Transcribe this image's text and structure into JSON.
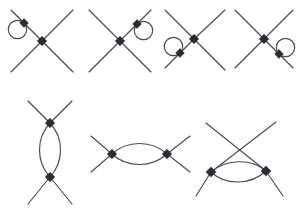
{
  "figure": {
    "type": "feynman-diagram-set",
    "background_color": "#ffffff",
    "line_color": "#4a4a52",
    "vertex_color": "#2b2b33",
    "line_width": 1.15,
    "canvas": {
      "width": 303,
      "height": 214
    },
    "rows": [
      {
        "name": "top-row",
        "description": "four four-point vertex diagrams each with one tadpole loop on a different leg",
        "diagram_count": 4
      },
      {
        "name": "bottom-row",
        "description": "three bubble (one-loop) diagrams",
        "diagram_count": 3
      }
    ],
    "diagrams": [
      {
        "id": "diagram-1",
        "name": "tadpole-upper-left-leg",
        "center_vertex": {
          "x": 42,
          "y": 41
        },
        "loop_vertex": {
          "x": 24,
          "y": 23
        },
        "loop_circle": {
          "cx": 17.5,
          "cy": 29.5,
          "r": 9.2
        },
        "legs": [
          {
            "x1": 42,
            "y1": 41,
            "x2": 11,
            "y2": 10
          },
          {
            "x1": 42,
            "y1": 41,
            "x2": 73,
            "y2": 10
          },
          {
            "x1": 42,
            "y1": 41,
            "x2": 11,
            "y2": 72
          },
          {
            "x1": 42,
            "y1": 41,
            "x2": 73,
            "y2": 72
          }
        ]
      },
      {
        "id": "diagram-2",
        "name": "tadpole-upper-right-leg",
        "center_vertex": {
          "x": 120,
          "y": 41
        },
        "loop_vertex": {
          "x": 137,
          "y": 24
        },
        "loop_circle": {
          "cx": 143.5,
          "cy": 30.5,
          "r": 9.2
        },
        "legs": [
          {
            "x1": 120,
            "y1": 41,
            "x2": 89,
            "y2": 10
          },
          {
            "x1": 120,
            "y1": 41,
            "x2": 151,
            "y2": 10
          },
          {
            "x1": 120,
            "y1": 41,
            "x2": 89,
            "y2": 72
          },
          {
            "x1": 120,
            "y1": 41,
            "x2": 151,
            "y2": 72
          }
        ]
      },
      {
        "id": "diagram-3",
        "name": "tadpole-lower-left-leg",
        "center_vertex": {
          "x": 194,
          "y": 39
        },
        "loop_vertex": {
          "x": 180,
          "y": 53
        },
        "loop_circle": {
          "cx": 173.5,
          "cy": 46.5,
          "r": 9.2
        },
        "legs": [
          {
            "x1": 194,
            "y1": 39,
            "x2": 165,
            "y2": 10
          },
          {
            "x1": 194,
            "y1": 39,
            "x2": 225,
            "y2": 10
          },
          {
            "x1": 194,
            "y1": 39,
            "x2": 165,
            "y2": 68
          },
          {
            "x1": 194,
            "y1": 39,
            "x2": 225,
            "y2": 70
          }
        ]
      },
      {
        "id": "diagram-4",
        "name": "tadpole-lower-right-leg",
        "center_vertex": {
          "x": 264,
          "y": 39
        },
        "loop_vertex": {
          "x": 279,
          "y": 54
        },
        "loop_circle": {
          "cx": 285.5,
          "cy": 47.5,
          "r": 9.2
        },
        "legs": [
          {
            "x1": 264,
            "y1": 39,
            "x2": 235,
            "y2": 10
          },
          {
            "x1": 264,
            "y1": 39,
            "x2": 293,
            "y2": 10
          },
          {
            "x1": 264,
            "y1": 39,
            "x2": 235,
            "y2": 68
          },
          {
            "x1": 264,
            "y1": 39,
            "x2": 293,
            "y2": 68
          }
        ]
      },
      {
        "id": "diagram-5",
        "name": "vertical-bubble",
        "vertices": [
          {
            "x": 50,
            "y": 123
          },
          {
            "x": 50,
            "y": 177
          }
        ],
        "bubble_orientation": "vertical",
        "bubble_width": 22,
        "legs": [
          {
            "x1": 50,
            "y1": 123,
            "x2": 28,
            "y2": 101
          },
          {
            "x1": 50,
            "y1": 123,
            "x2": 72,
            "y2": 101
          },
          {
            "x1": 50,
            "y1": 177,
            "x2": 28,
            "y2": 204
          },
          {
            "x1": 50,
            "y1": 177,
            "x2": 72,
            "y2": 204
          }
        ]
      },
      {
        "id": "diagram-6",
        "name": "horizontal-bubble",
        "vertices": [
          {
            "x": 112,
            "y": 154
          },
          {
            "x": 167,
            "y": 154
          }
        ],
        "bubble_orientation": "horizontal",
        "bubble_height": 19,
        "legs": [
          {
            "x1": 112,
            "y1": 154,
            "x2": 91,
            "y2": 136
          },
          {
            "x1": 112,
            "y1": 154,
            "x2": 91,
            "y2": 172
          },
          {
            "x1": 167,
            "y1": 154,
            "x2": 190,
            "y2": 136
          },
          {
            "x1": 167,
            "y1": 154,
            "x2": 190,
            "y2": 172
          }
        ]
      },
      {
        "id": "diagram-7",
        "name": "crossed-horizontal-bubble",
        "vertices": [
          {
            "x": 211,
            "y": 172
          },
          {
            "x": 266,
            "y": 171
          }
        ],
        "bubble_orientation": "horizontal",
        "bubble_height": 17,
        "legs": [
          {
            "x1": 211,
            "y1": 172,
            "x2": 276,
            "y2": 122
          },
          {
            "x1": 266,
            "y1": 171,
            "x2": 206,
            "y2": 123
          },
          {
            "x1": 211,
            "y1": 172,
            "x2": 196,
            "y2": 196
          },
          {
            "x1": 266,
            "y1": 171,
            "x2": 283,
            "y2": 196
          }
        ]
      }
    ],
    "vertex_marker": {
      "shape": "square",
      "size": 6.2,
      "rotation_deg": 45
    }
  }
}
